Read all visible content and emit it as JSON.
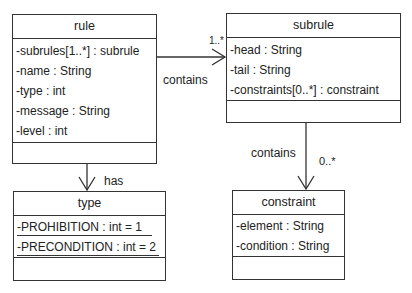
{
  "classes": {
    "rule": {
      "name": "rule",
      "attributes": [
        "-subrules[1..*] : subrule",
        "-name : String",
        "-type : int",
        "-message : String",
        "-level : int"
      ]
    },
    "subrule": {
      "name": "subrule",
      "attributes": [
        "-head : String",
        "-tail : String",
        "-constraints[0..*] : constraint"
      ]
    },
    "type": {
      "name": "type",
      "attributes": [
        "-PROHIBITION : int = 1",
        "-PRECONDITION : int = 2"
      ]
    },
    "constraint": {
      "name": "constraint",
      "attributes": [
        "-element : String",
        "-condition : String"
      ]
    }
  },
  "associations": {
    "rule_subrule": {
      "label": "contains",
      "multiplicity": "1..*"
    },
    "rule_type": {
      "label": "has"
    },
    "subrule_constraint": {
      "label": "contains",
      "multiplicity": "0..*"
    }
  }
}
